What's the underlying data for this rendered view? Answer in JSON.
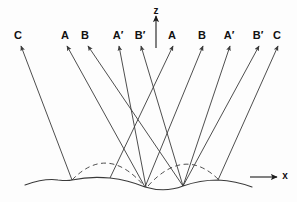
{
  "figure": {
    "background_color": "#fdfdfd",
    "line_color": "#3a3a3a",
    "text_color": "#111111",
    "width": 297,
    "height": 202
  },
  "axes": {
    "z": {
      "label": "z",
      "label_x": 156,
      "label_y": 6,
      "x1": 156,
      "y1": 48,
      "x2": 156,
      "y2": 16
    },
    "x": {
      "label": "x",
      "label_x": 285,
      "label_y": 171,
      "x1": 250,
      "y1": 177,
      "x2": 277,
      "y2": 177
    }
  },
  "beams": [
    {
      "id": "beam-c-left",
      "label": "C",
      "label_x": 18,
      "label_y": 30,
      "x1": 72,
      "y1": 180,
      "x2": 21,
      "y2": 46
    },
    {
      "id": "beam-a-left",
      "label": "A",
      "label_x": 65,
      "label_y": 30,
      "x1": 145,
      "y1": 187,
      "x2": 67,
      "y2": 46
    },
    {
      "id": "beam-b-left",
      "label": "B",
      "label_x": 85,
      "label_y": 30,
      "x1": 183,
      "y1": 186,
      "x2": 88,
      "y2": 46
    },
    {
      "id": "beam-aprime-left",
      "label": "A′",
      "label_x": 118,
      "label_y": 30,
      "x1": 146,
      "y1": 187,
      "x2": 119,
      "y2": 46
    },
    {
      "id": "beam-bprime-left",
      "label": "B′",
      "label_x": 140,
      "label_y": 30,
      "x1": 183,
      "y1": 186,
      "x2": 141,
      "y2": 46
    },
    {
      "id": "beam-a-right",
      "label": "A",
      "label_x": 172,
      "label_y": 30,
      "x1": 110,
      "y1": 178,
      "x2": 173,
      "y2": 46
    },
    {
      "id": "beam-b-right",
      "label": "B",
      "label_x": 202,
      "label_y": 30,
      "x1": 145,
      "y1": 187,
      "x2": 203,
      "y2": 46
    },
    {
      "id": "beam-aprime-right",
      "label": "A′",
      "label_x": 229,
      "label_y": 30,
      "x1": 183,
      "y1": 186,
      "x2": 230,
      "y2": 46
    },
    {
      "id": "beam-bprime-right",
      "label": "B′",
      "label_x": 258,
      "label_y": 30,
      "x1": 183,
      "y1": 186,
      "x2": 259,
      "y2": 46
    },
    {
      "id": "beam-c-right",
      "label": "C",
      "label_x": 277,
      "label_y": 30,
      "x1": 218,
      "y1": 180,
      "x2": 278,
      "y2": 46
    }
  ],
  "surface": {
    "name": "corrugated-surface",
    "path": "M 25 185 Q 45 178 58 180 Q 68 181 72 180 Q 90 176 110 178 Q 128 180 145 187 Q 165 193 183 186 Q 200 180 218 180 Q 236 181 252 187",
    "crest_points": [
      {
        "x": 72,
        "y": 180
      },
      {
        "x": 110,
        "y": 178
      },
      {
        "x": 145,
        "y": 187
      },
      {
        "x": 183,
        "y": 186
      },
      {
        "x": 218,
        "y": 180
      }
    ]
  },
  "dashed_arcs": [
    {
      "name": "dashed-arc-left",
      "path": "M 72 180 Q 108 143 145 187"
    },
    {
      "name": "dashed-arc-right",
      "path": "M 148 186 Q 185 145 220 181"
    }
  ]
}
